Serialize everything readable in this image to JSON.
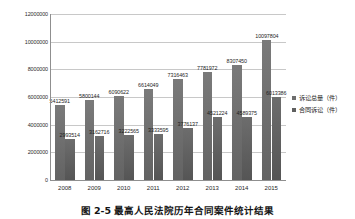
{
  "chart_data": {
    "type": "bar",
    "title": "",
    "xlabel": "",
    "ylabel": "",
    "categories": [
      "2008",
      "2009",
      "2010",
      "2011",
      "2012",
      "2013",
      "2014",
      "2015"
    ],
    "series": [
      {
        "name": "诉讼总量（件）",
        "color": "#6e6e6e",
        "values": [
          5412591,
          5800144,
          6090622,
          6614049,
          7316463,
          7781972,
          8307450,
          10097804
        ]
      },
      {
        "name": "合同诉讼（件）",
        "color": "#5f5f5f",
        "values": [
          2993514,
          3162716,
          3222565,
          3333595,
          3776137,
          4521224,
          4589375,
          6013386
        ]
      }
    ],
    "ylim": [
      0,
      12000000
    ],
    "yticks": [
      "0",
      "2000000",
      "4000000",
      "6000000",
      "8000000",
      "10000000",
      "12000000"
    ],
    "ytick_values": [
      0,
      2000000,
      4000000,
      6000000,
      8000000,
      10000000,
      12000000
    ],
    "grid": true,
    "legend_position": "right",
    "data_labels": true
  },
  "caption": "图 2-5  最高人民法院历年合同案件统计结果"
}
